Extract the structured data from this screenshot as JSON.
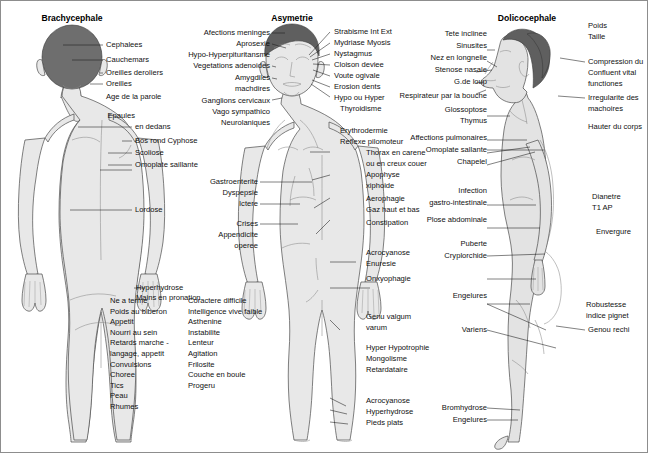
{
  "figures": {
    "left": {
      "title": "Brachycephale"
    },
    "center": {
      "title": "Asymetrie"
    },
    "right": {
      "title": "Dolicocephale"
    }
  },
  "left_labels": [
    "Cephalees",
    "Cauchemars",
    "Oreilles deroliers",
    "Oreilles",
    "Age de la parole",
    "Epaules",
    "en dedans",
    "Bos rond Cyphose",
    "Scoliose",
    "Omoplate saillante",
    "Lordose",
    "Hyperhydrose",
    "Mains en pronation"
  ],
  "left_list_a": [
    "Ne a terme",
    "Poids au biberon",
    "Appetit",
    "Nourri au sein",
    "Retards marche -",
    "langage, appetit",
    "Convulsions",
    "Choree",
    "Tics",
    "Peau",
    "Rhumes"
  ],
  "left_list_b": [
    "Coractere difficile",
    "Intelligence vive faible",
    "Asthenine",
    "Instabilite",
    "Lenteur",
    "Agitation",
    "Frilosite",
    "Couche en boule",
    "Progeru"
  ],
  "center_left_labels": [
    "Afections meninges",
    "Aprosexie",
    "Hypo-Hyperpituritansme",
    "Vegetations adenoides",
    "Amygdiles",
    "machdires",
    "Ganglions cervicaux",
    "Vago sympathico",
    "Neurolaniques",
    "Gastroenterite",
    "Dyspepsie",
    "Ictere",
    "Crises",
    "Appendicite",
    "operee"
  ],
  "center_right_labels": [
    "Strabisme Int Ext",
    "Mydriase Myosis",
    "Nystagmus",
    "Cloison deviee",
    "Voute ogivale",
    "Erosion dents",
    "Hypo ou Hyper",
    "Thyroidisme",
    "Erythrodermie",
    "Reflexe pilomoteur",
    "Thorax en carene",
    "ou en creux couer",
    "Apophyse",
    "xiphoide",
    "Aerophagie",
    "Gaz haut et bas",
    "Constipation",
    "Acrocyanose",
    "Enuresie",
    "Onxyophagie",
    "Genu valgum",
    "varum",
    "Hyper Hypotrophie",
    "Mongolisme",
    "Retardataire",
    "Acrocyanose",
    "Hyperhydrose",
    "Pieds plats"
  ],
  "right_left_labels": [
    "Tete inclinee",
    "Sinusites",
    "Nez en longnelle",
    "Stenose nasale",
    "G.de loup",
    "Respirateur par la bouche",
    "Glossoptose",
    "Thymus",
    "Affections pulmonaires",
    "Omoplate sallante",
    "Chapelel",
    "Infection",
    "gastro-intestinale",
    "Plose abdominale",
    "Puberte",
    "Cryplorchide",
    "Engelures",
    "Variens",
    "Bromhydrose",
    "Engelures"
  ],
  "right_far_labels": [
    "Poids",
    "Taille",
    "Compression du",
    "Confluent vital",
    "functiones",
    "Irregularite des",
    "machoires",
    "Hauter du corps",
    "Dianetre",
    "T1  AP",
    "Envergure",
    "Robustesse",
    "indice pignet",
    "Genou rechi"
  ],
  "colors": {
    "hair": "#6e6e6e",
    "body": "#e8e8e8",
    "outline": "#4a4a4a",
    "leader": "#1a1a1a",
    "frame": "#8d8d8d"
  }
}
